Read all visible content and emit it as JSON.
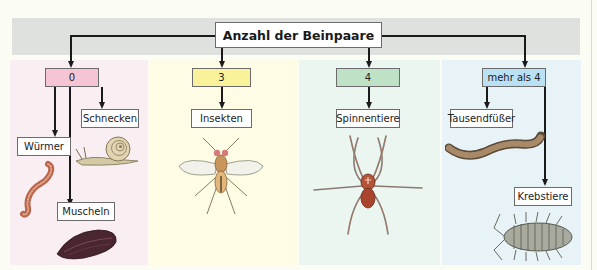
{
  "diagram": {
    "title": "Anzahl der Beinpaare",
    "categories": [
      {
        "label": "0",
        "color": "#f5c5d5",
        "background": "#f9eef2",
        "children": [
          "Würmer",
          "Schnecken",
          "Muscheln"
        ]
      },
      {
        "label": "3",
        "color": "#faf29a",
        "background": "#fefce4",
        "children": [
          "Insekten"
        ]
      },
      {
        "label": "4",
        "color": "#bfe2c7",
        "background": "#eaf6ef",
        "children": [
          "Spinnentiere"
        ]
      },
      {
        "label": "mehr als 4",
        "color": "#b9e1f3",
        "background": "#e8f3f7",
        "children": [
          "Tausendfüßer",
          "Krebstiere"
        ]
      }
    ],
    "illustrations": [
      "worm-illustration",
      "snail-illustration",
      "mussel-illustration",
      "fly-illustration",
      "spider-illustration",
      "millipede-illustration",
      "woodlouse-illustration"
    ]
  }
}
